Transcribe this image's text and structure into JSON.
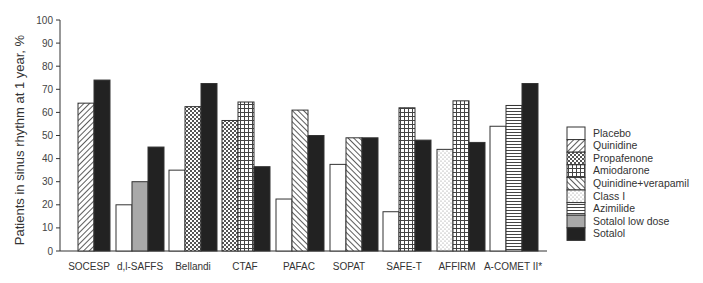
{
  "chart_data": {
    "type": "bar",
    "title": "",
    "xlabel": "",
    "ylabel": "Patients in sinus rhythm at 1 year, %",
    "ylim": [
      0,
      100
    ],
    "yticks": [
      0,
      10,
      20,
      30,
      40,
      50,
      60,
      70,
      80,
      90,
      100
    ],
    "grid": false,
    "legend_position": "right",
    "categories": [
      "SOCESP",
      "d,l-SAFFS",
      "Bellandi",
      "CTAF",
      "PAFAC",
      "SOPAT",
      "SAFE-T",
      "AFFIRM",
      "A-COMET II*"
    ],
    "series_defs": [
      {
        "name": "Placebo",
        "pattern": "placebo"
      },
      {
        "name": "Quinidine",
        "pattern": "quinidine"
      },
      {
        "name": "Propafenone",
        "pattern": "propafenone"
      },
      {
        "name": "Amiodarone",
        "pattern": "amiodarone"
      },
      {
        "name": "Quinidine+verapamil",
        "pattern": "quinver"
      },
      {
        "name": "Class I",
        "pattern": "class1"
      },
      {
        "name": "Azimilide",
        "pattern": "azimilide"
      },
      {
        "name": "Sotalol low dose",
        "pattern": "sotalow"
      },
      {
        "name": "Sotalol",
        "pattern": "sotalol"
      }
    ],
    "groups": [
      {
        "category": "SOCESP",
        "bars": [
          {
            "series": "Quinidine",
            "value": 64
          },
          {
            "series": "Sotalol",
            "value": 74
          }
        ]
      },
      {
        "category": "d,l-SAFFS",
        "bars": [
          {
            "series": "Placebo",
            "value": 20
          },
          {
            "series": "Sotalol low dose",
            "value": 30
          },
          {
            "series": "Sotalol",
            "value": 45
          }
        ]
      },
      {
        "category": "Bellandi",
        "bars": [
          {
            "series": "Placebo",
            "value": 35
          },
          {
            "series": "Propafenone",
            "value": 62.5
          },
          {
            "series": "Sotalol",
            "value": 72.5
          }
        ]
      },
      {
        "category": "CTAF",
        "bars": [
          {
            "series": "Propafenone",
            "value": 56.5
          },
          {
            "series": "Amiodarone",
            "value": 64.5
          },
          {
            "series": "Sotalol",
            "value": 36.5
          }
        ]
      },
      {
        "category": "PAFAC",
        "bars": [
          {
            "series": "Placebo",
            "value": 22.5
          },
          {
            "series": "Quinidine+verapamil",
            "value": 61
          },
          {
            "series": "Sotalol",
            "value": 50
          }
        ]
      },
      {
        "category": "SOPAT",
        "bars": [
          {
            "series": "Placebo",
            "value": 37.5
          },
          {
            "series": "Quinidine+verapamil",
            "value": 49
          },
          {
            "series": "Sotalol",
            "value": 49
          }
        ]
      },
      {
        "category": "SAFE-T",
        "bars": [
          {
            "series": "Placebo",
            "value": 17
          },
          {
            "series": "Amiodarone",
            "value": 62
          },
          {
            "series": "Sotalol",
            "value": 48
          }
        ]
      },
      {
        "category": "AFFIRM",
        "bars": [
          {
            "series": "Class I",
            "value": 44
          },
          {
            "series": "Amiodarone",
            "value": 65
          },
          {
            "series": "Sotalol",
            "value": 47
          }
        ]
      },
      {
        "category": "A-COMET II*",
        "bars": [
          {
            "series": "Placebo",
            "value": 54
          },
          {
            "series": "Azimilide",
            "value": 63
          },
          {
            "series": "Sotalol",
            "value": 72.5
          }
        ]
      }
    ]
  }
}
